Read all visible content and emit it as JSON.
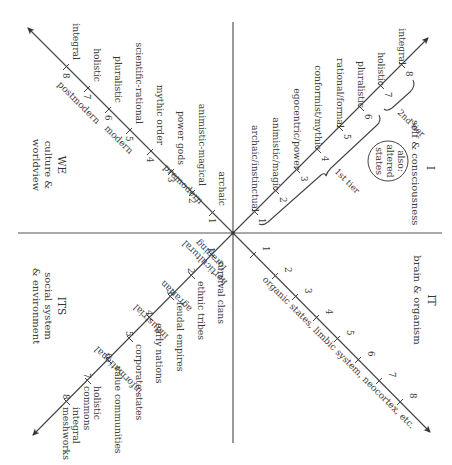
{
  "diagram": {
    "orientation": "rotated 90 degrees clockwise",
    "quadrants": {
      "upper_right": {
        "code": "I",
        "caption": "self & consciousness",
        "note": [
          "also:",
          "altered",
          "states"
        ],
        "ticks": [
          "1",
          "2",
          "3",
          "4",
          "5",
          "6",
          "7",
          "8"
        ],
        "stages": [
          "archaic/instinctual",
          "animistic/magic",
          "egocentric/power",
          "conformist/mythic",
          "rational/formal",
          "pluralistic",
          "holistic",
          "integral"
        ],
        "tiers": [
          "1st tier",
          "2nd tier"
        ]
      },
      "upper_left": {
        "code": "WE",
        "caption": [
          "culture &",
          "worldview"
        ],
        "ticks": [
          "1",
          "2",
          "3",
          "4",
          "5",
          "6",
          "7",
          "8"
        ],
        "stages": [
          "archaic",
          "animistic-magical",
          "power gods",
          "mythic order",
          "scientific-rational",
          "pluralistic",
          "holistic",
          "integral"
        ],
        "eras": [
          "premodern",
          "modern",
          "postmodern"
        ]
      },
      "lower_left": {
        "code": "ITS",
        "caption": [
          "social system",
          "& environment"
        ],
        "ticks": [
          "1",
          "2",
          "3",
          "4",
          "5",
          "6",
          "7",
          "8"
        ],
        "stages": [
          "survival clans",
          "ethnic tribes",
          "feudal empires",
          "early nations",
          "corporate states",
          "value communities",
          [
            "holistic",
            "commons"
          ],
          [
            "integral",
            "meshworks"
          ]
        ],
        "techno_economic": [
          "foraging",
          "horticultural",
          "agrarian",
          "industrial",
          "informational"
        ]
      },
      "lower_right": {
        "code": "IT",
        "caption": "brain & organism",
        "ticks": [
          "1",
          "2",
          "3",
          "4",
          "5",
          "6",
          "7",
          "8"
        ],
        "line_label": "organic states, limbic system, neocortex, etc."
      }
    },
    "colors": {
      "ink": "#3a3a3a",
      "axis": "#555555",
      "background": "#ffffff"
    }
  }
}
